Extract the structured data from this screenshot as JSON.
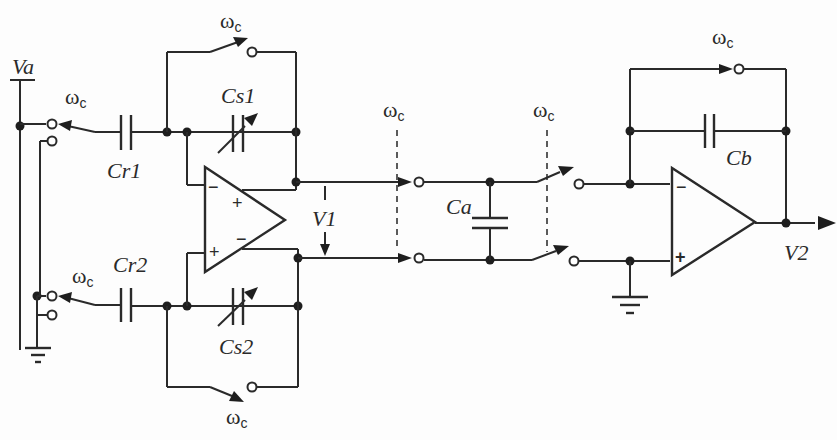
{
  "diagram": {
    "type": "switched-capacitor circuit schematic",
    "labels": {
      "va": "Va",
      "cr1": "Cr1",
      "cr2": "Cr2",
      "cs1": "Cs1",
      "cs2": "Cs2",
      "v1": "V1",
      "ca": "Ca",
      "cb": "Cb",
      "v2": "V2"
    },
    "switch_phase": {
      "symbol": "ω",
      "subscript": "c"
    },
    "opamps": [
      {
        "name": "differential-opamp",
        "inputs": [
          "−",
          "+"
        ],
        "outputs": [
          "+",
          "−"
        ]
      },
      {
        "name": "output-opamp",
        "inputs": [
          "−",
          "+"
        ]
      }
    ],
    "colors": {
      "line": "#2a2a2a",
      "background": "#fdfdfd"
    }
  }
}
